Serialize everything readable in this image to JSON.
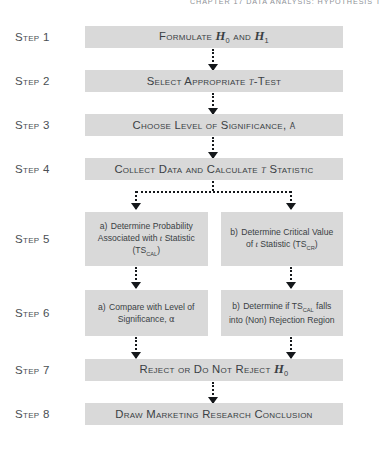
{
  "page": {
    "running_head": "CHAPTER 17    DATA ANALYSIS: HYPOTHESIS T",
    "box_fill": "#d9d9d9",
    "text_color": "#3a3f44",
    "connector_color": "#15181b",
    "width": 385,
    "height": 458
  },
  "steps": [
    {
      "label": "Step 1",
      "layout": "single",
      "boxes": [
        {
          "prefix": "",
          "text_plain": "Formulate H0 and H1"
        }
      ]
    },
    {
      "label": "Step 2",
      "layout": "single",
      "boxes": [
        {
          "prefix": "",
          "text_plain": "Select Appropriate t-Test"
        }
      ]
    },
    {
      "label": "Step 3",
      "layout": "single",
      "boxes": [
        {
          "prefix": "",
          "text_plain": "Choose Level of Significance, α"
        }
      ]
    },
    {
      "label": "Step 4",
      "layout": "single",
      "boxes": [
        {
          "prefix": "",
          "text_plain": "Collect Data and Calculate t Statistic"
        }
      ]
    },
    {
      "label": "Step 5",
      "layout": "split",
      "boxes": [
        {
          "prefix": "a)",
          "text_plain": "Determine Probability Associated with t Statistic (TSCAL)"
        },
        {
          "prefix": "b)",
          "text_plain": "Determine Critical Value of t Statistic (TSCR)"
        }
      ]
    },
    {
      "label": "Step 6",
      "layout": "split",
      "boxes": [
        {
          "prefix": "a)",
          "text_plain": "Compare with Level of Significance, α"
        },
        {
          "prefix": "b)",
          "text_plain": "Determine if TSCAL falls into (Non) Rejection Region"
        }
      ]
    },
    {
      "label": "Step 7",
      "layout": "single",
      "boxes": [
        {
          "prefix": "",
          "text_plain": "Reject or Do Not Reject H0"
        }
      ]
    },
    {
      "label": "Step 8",
      "layout": "single",
      "boxes": [
        {
          "prefix": "",
          "text_plain": "Draw Marketing Research Conclusion"
        }
      ]
    }
  ]
}
